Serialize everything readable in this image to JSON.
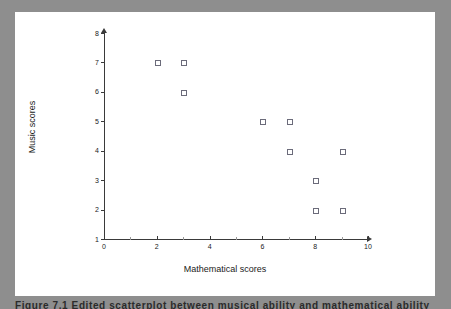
{
  "figure": {
    "caption": "Figure 7.1  Edited scatterplot between musical ability and mathematical ability",
    "background_color": "#8e8e8e",
    "panel_color": "#ffffff"
  },
  "chart_data": {
    "type": "scatter",
    "title": "",
    "xlabel": "Mathematical scores",
    "ylabel": "Music scores",
    "xlim": [
      0,
      10
    ],
    "ylim": [
      1,
      8
    ],
    "xticks": [
      0,
      2,
      4,
      6,
      8,
      10
    ],
    "xticks_minor": [
      1,
      3,
      5,
      7,
      9
    ],
    "yticks": [
      1,
      2,
      3,
      4,
      5,
      6,
      7,
      8
    ],
    "grid": false,
    "legend": null,
    "marker": "open-square",
    "marker_color": "#6b6b7a",
    "points": [
      {
        "x": 2,
        "y": 7
      },
      {
        "x": 3,
        "y": 7
      },
      {
        "x": 3,
        "y": 6
      },
      {
        "x": 6,
        "y": 5
      },
      {
        "x": 7,
        "y": 5
      },
      {
        "x": 7,
        "y": 4
      },
      {
        "x": 9,
        "y": 4
      },
      {
        "x": 8,
        "y": 3
      },
      {
        "x": 8,
        "y": 2
      },
      {
        "x": 9,
        "y": 2
      }
    ]
  }
}
